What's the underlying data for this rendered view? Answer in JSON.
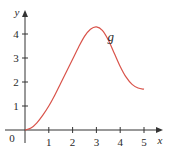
{
  "chart_data": {
    "type": "line",
    "title": "",
    "xlabel": "x",
    "ylabel": "y",
    "xlim": [
      0,
      5.3
    ],
    "ylim": [
      0,
      4.6
    ],
    "grid": false,
    "x_ticks": [
      "1",
      "2",
      "3",
      "4",
      "5"
    ],
    "y_ticks": [
      "1",
      "2",
      "3",
      "4"
    ],
    "origin_label": "0",
    "series": [
      {
        "name": "g",
        "color": "#d9534a",
        "x": [
          0,
          0.25,
          0.5,
          0.75,
          1,
          1.25,
          1.5,
          1.75,
          2,
          2.25,
          2.5,
          2.75,
          3,
          3.25,
          3.5,
          3.75,
          4,
          4.25,
          4.5,
          4.75,
          5
        ],
        "values": [
          0,
          0.08,
          0.3,
          0.62,
          1.0,
          1.45,
          1.95,
          2.45,
          2.95,
          3.45,
          3.9,
          4.2,
          4.3,
          4.15,
          3.75,
          3.2,
          2.65,
          2.2,
          1.9,
          1.75,
          1.7
        ]
      }
    ],
    "annotations": [
      {
        "text": "g",
        "x": 3.6,
        "y": 3.7
      }
    ]
  }
}
